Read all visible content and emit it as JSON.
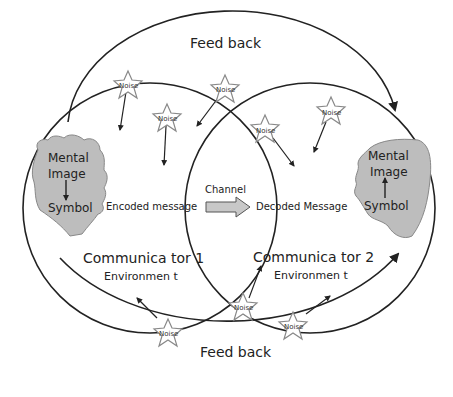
{
  "diagram": {
    "type": "communication-model",
    "feedback_top": "Feed back",
    "feedback_bottom": "Feed back",
    "channel": "Channel",
    "communicator1": {
      "title": "Communica tor 1",
      "environment": "Environmen t",
      "mental_image": [
        "Mental",
        "Image"
      ],
      "symbol": "Symbol",
      "message": "Encoded message"
    },
    "communicator2": {
      "title": "Communica tor 2",
      "environment": "Environmen t",
      "mental_image": [
        "Mental",
        "Image"
      ],
      "symbol": "Symbol",
      "message": "Decoded Message"
    },
    "noise_label": "Noise",
    "noise_count": 8,
    "colors": {
      "line": "#222222",
      "head_fill": "#bdbdbd",
      "star_stroke": "#888888",
      "arrow_fill": "#c8c8c8"
    }
  }
}
